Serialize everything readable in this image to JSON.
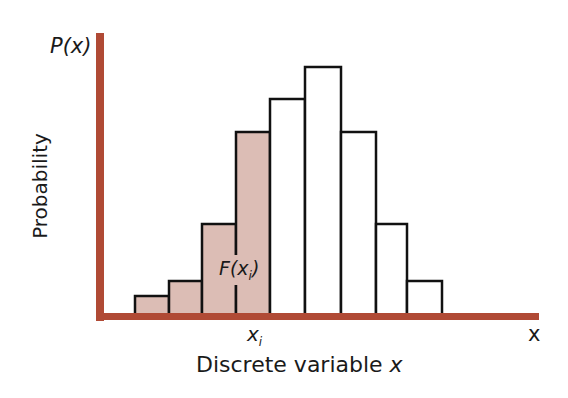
{
  "chart_data": {
    "type": "bar",
    "title": "",
    "xlabel": "Discrete variable x",
    "ylabel": "Probability",
    "y_axis_title": "P(x)",
    "x_axis_end_label": "x",
    "marked_value_label": "x_i",
    "cumulative_label": "F(x_i)",
    "grid": false,
    "legend": null,
    "bar_count": 9,
    "bar_edges_px": [
      135,
      169,
      202,
      236,
      270,
      305,
      341,
      376,
      407,
      442
    ],
    "values_relative": [
      0.08,
      0.14,
      0.37,
      0.74,
      0.87,
      1.0,
      0.74,
      0.37,
      0.14
    ],
    "shaded_bars": [
      0,
      1,
      2,
      3
    ],
    "shaded_meaning": "cumulative probability F(x_i) = sum of P(x) for x <= x_i",
    "colors": {
      "axis": "#b04a35",
      "shaded_fill": "#dcbdb5",
      "unshaded_fill": "#ffffff",
      "bar_outline": "#111111"
    }
  },
  "labels": {
    "p_of_x": "P(x)",
    "probability": "Probability",
    "x_i_base": "x",
    "x_i_sub": "i",
    "x_end": "x",
    "discrete": "Discrete variable ",
    "discrete_var": "x",
    "F_base": "F(",
    "F_var": "x",
    "F_sub": "i",
    "F_close": ")"
  }
}
